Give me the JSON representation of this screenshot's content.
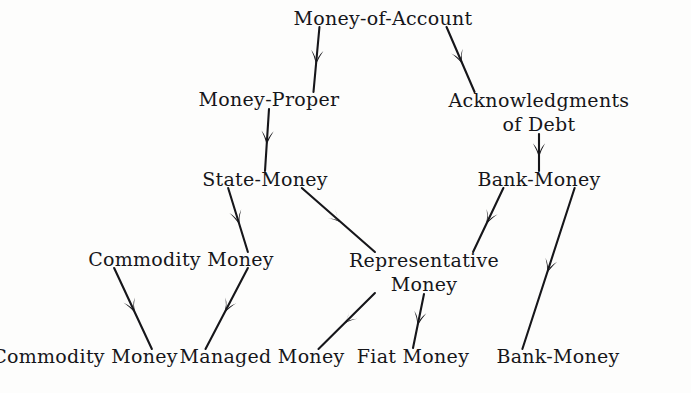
{
  "diagram": {
    "type": "hierarchy-tree",
    "background_color": "#fdfdfc",
    "ink_color": "#16161a",
    "nodes": [
      {
        "id": "money-of-account",
        "label": "Money-of-Account",
        "lines": [
          "Money-of-Account"
        ],
        "x": 383,
        "y": 24,
        "level": 0
      },
      {
        "id": "money-proper",
        "label": "Money-Proper",
        "lines": [
          "Money-Proper"
        ],
        "x": 269,
        "y": 105,
        "level": 1
      },
      {
        "id": "acknowledgments-of-debt",
        "label": "Acknowledgments of Debt",
        "lines": [
          "Acknowledgments",
          "of Debt"
        ],
        "x": 539,
        "y": 105,
        "level": 1
      },
      {
        "id": "state-money",
        "label": "State-Money",
        "lines": [
          "State-Money"
        ],
        "x": 265,
        "y": 185,
        "level": 2
      },
      {
        "id": "bank-money",
        "label": "Bank-Money",
        "lines": [
          "Bank-Money"
        ],
        "x": 539,
        "y": 185,
        "level": 2
      },
      {
        "id": "commodity-money-mid",
        "label": "Commodity Money",
        "lines": [
          "Commodity Money"
        ],
        "x": 181,
        "y": 265,
        "level": 3
      },
      {
        "id": "representative-money",
        "label": "Representative Money",
        "lines": [
          "Representative",
          "Money"
        ],
        "x": 424,
        "y": 265,
        "level": 3
      },
      {
        "id": "commodity-money-leaf",
        "label": "Commodity Money",
        "lines": [
          "Commodity Money"
        ],
        "x": 85,
        "y": 362,
        "level": 4
      },
      {
        "id": "managed-money",
        "label": "Managed Money",
        "lines": [
          "Managed Money"
        ],
        "x": 262,
        "y": 362,
        "level": 4
      },
      {
        "id": "fiat-money",
        "label": "Fiat Money",
        "lines": [
          "Fiat Money"
        ],
        "x": 413,
        "y": 362,
        "level": 4
      },
      {
        "id": "bank-money-leaf",
        "label": "Bank-Money",
        "lines": [
          "Bank-Money"
        ],
        "x": 558,
        "y": 362,
        "level": 4
      }
    ],
    "edges": [
      {
        "id": "edge-moa-money-proper",
        "from": "money-of-account",
        "to": "money-proper",
        "arrow": "mid"
      },
      {
        "id": "edge-moa-acknowledgments",
        "from": "money-of-account",
        "to": "acknowledgments-of-debt",
        "arrow": "mid"
      },
      {
        "id": "edge-money-proper-state",
        "from": "money-proper",
        "to": "state-money",
        "arrow": "mid"
      },
      {
        "id": "edge-acknowledgments-bank",
        "from": "acknowledgments-of-debt",
        "to": "bank-money",
        "arrow": "mid"
      },
      {
        "id": "edge-state-commodity",
        "from": "state-money",
        "to": "commodity-money-mid",
        "arrow": "mid"
      },
      {
        "id": "edge-state-representative",
        "from": "state-money",
        "to": "representative-money",
        "arrow": "mid"
      },
      {
        "id": "edge-bank-representative",
        "from": "bank-money",
        "to": "representative-money",
        "arrow": "mid"
      },
      {
        "id": "edge-bank-bank-leaf",
        "from": "bank-money",
        "to": "bank-money-leaf",
        "arrow": "mid"
      },
      {
        "id": "edge-commodity-commodity",
        "from": "commodity-money-mid",
        "to": "commodity-money-leaf",
        "arrow": "mid"
      },
      {
        "id": "edge-commodity-managed",
        "from": "commodity-money-mid",
        "to": "managed-money",
        "arrow": "mid"
      },
      {
        "id": "edge-representative-managed",
        "from": "representative-money",
        "to": "managed-money",
        "arrow": "mid"
      },
      {
        "id": "edge-representative-fiat",
        "from": "representative-money",
        "to": "fiat-money",
        "arrow": "mid"
      }
    ]
  }
}
